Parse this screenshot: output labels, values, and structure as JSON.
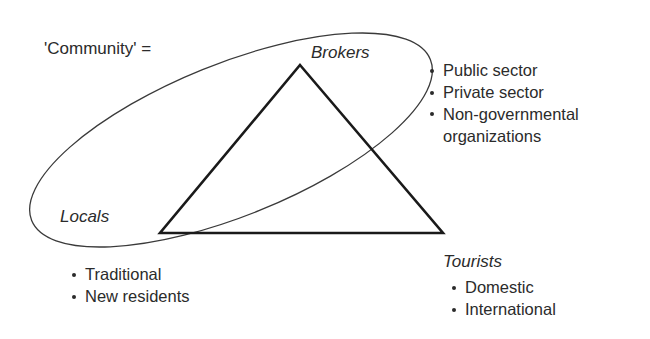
{
  "diagram": {
    "title_label": "'Community' =",
    "groups": {
      "brokers": {
        "label": "Brokers",
        "items": [
          "Public sector",
          "Private sector",
          "Non-governmental"
        ],
        "item_continuation": "organizations"
      },
      "locals": {
        "label": "Locals",
        "items": [
          "Traditional",
          "New residents"
        ]
      },
      "tourists": {
        "label": "Tourists",
        "items": [
          "Domestic",
          "International"
        ]
      }
    },
    "shapes": {
      "triangle": {
        "name": "triangle-outline",
        "apex": [
          300,
          65
        ],
        "left_vertex": [
          160,
          233
        ],
        "right_vertex": [
          443,
          233
        ],
        "stroke": "#1a1a1a",
        "stroke_width": 2.6,
        "fill": "none"
      },
      "ellipse": {
        "name": "community-ellipse",
        "center": [
          231,
          140
        ],
        "rx": 215,
        "ry": 76,
        "rotation_deg": -22,
        "stroke": "#3a3a3a",
        "stroke_width": 1.3,
        "fill": "none"
      }
    },
    "colors": {
      "background": "#ffffff",
      "text": "#2b2b2b",
      "triangle_stroke": "#1a1a1a",
      "ellipse_stroke": "#3a3a3a"
    }
  }
}
